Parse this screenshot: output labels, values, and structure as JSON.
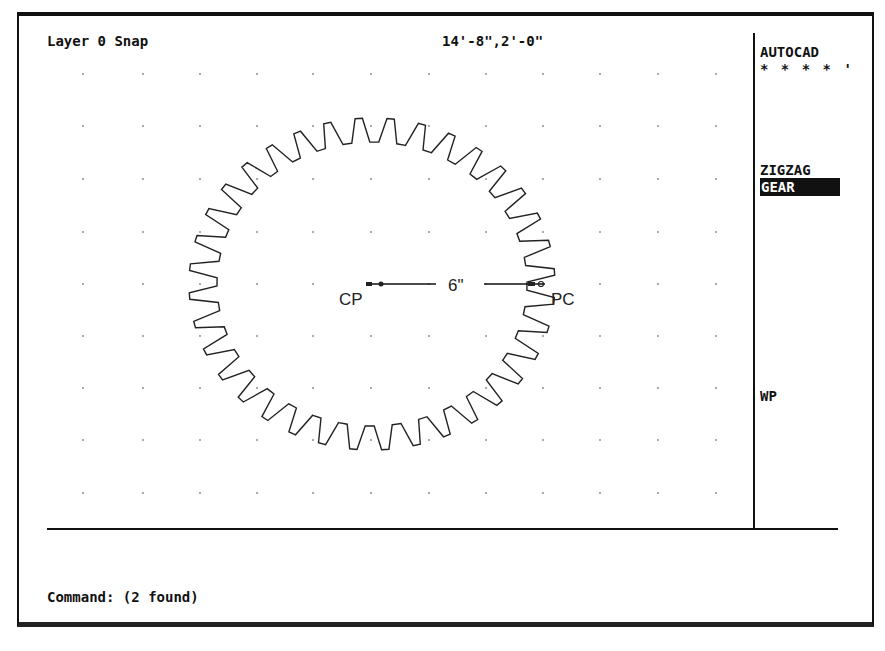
{
  "app": {
    "name": "AUTOCAD",
    "status_bar": {
      "layer_snap": "Layer 0 Snap",
      "coordinates": "14'-8\",2'-0\""
    }
  },
  "side_menu": {
    "title": "AUTOCAD",
    "stars": "* * * * '",
    "items": [
      {
        "label": "ZIGZAG",
        "selected": false
      },
      {
        "label": "GEAR",
        "selected": true
      },
      {
        "label": "WP",
        "selected": false
      }
    ]
  },
  "drawing": {
    "grid": {
      "x": [
        83,
        143,
        200,
        257,
        313,
        371,
        429,
        486,
        543,
        600,
        658,
        716
      ],
      "y": [
        74,
        126,
        179,
        232,
        284,
        336,
        388,
        440,
        493
      ]
    },
    "gear": {
      "center": [
        372,
        284
      ],
      "outer_radius": [
        183,
        166
      ],
      "inner_radius": [
        155,
        142
      ],
      "teeth": 36
    },
    "dimension": {
      "label": "6\"",
      "start_label": "CP",
      "end_label": "PC"
    }
  },
  "command": {
    "prompt": "Command: (2 found)"
  },
  "colors": {
    "ink": "#111111",
    "background": "#ffffff",
    "highlight_bg": "#111111",
    "highlight_fg": "#ffffff"
  }
}
